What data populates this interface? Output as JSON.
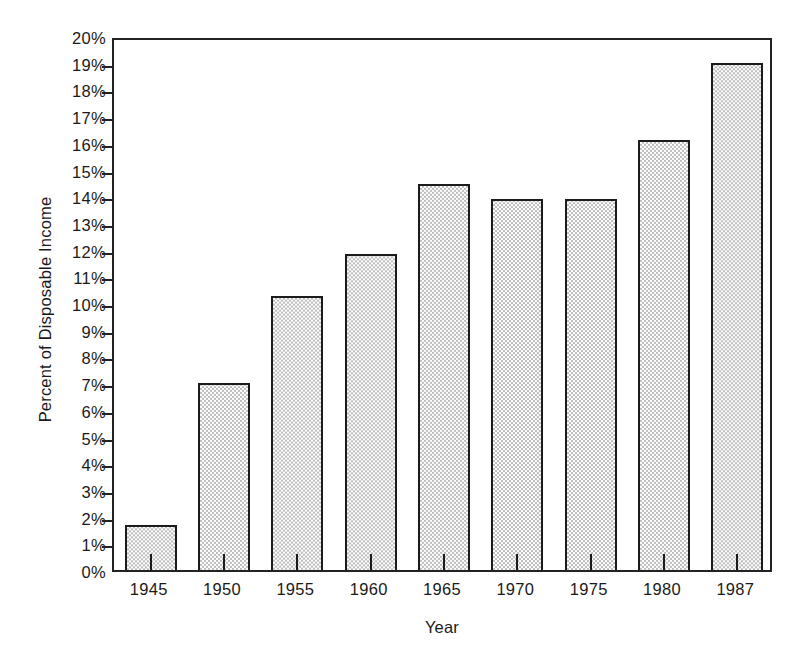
{
  "chart_data": {
    "type": "bar",
    "title": "",
    "subtitle": "",
    "xlabel": "Year",
    "ylabel": "Percent of Disposable Income",
    "categories": [
      "1945",
      "1950",
      "1955",
      "1960",
      "1965",
      "1970",
      "1975",
      "1980",
      "1987"
    ],
    "values": [
      1.7,
      7.0,
      10.25,
      11.85,
      14.45,
      13.9,
      13.9,
      16.1,
      19.0
    ],
    "ylim": [
      0,
      20
    ],
    "ytick_step": 1,
    "ytick_labels": [
      "0%",
      "1%",
      "2%",
      "3%",
      "4%",
      "5%",
      "6%",
      "7%",
      "8%",
      "9%",
      "10%",
      "11%",
      "12%",
      "13%",
      "14%",
      "15%",
      "16%",
      "17%",
      "18%",
      "19%",
      "20%"
    ],
    "xtick_labels": [
      "1945",
      "1950",
      "1955",
      "1960",
      "1965",
      "1970",
      "1975",
      "1980",
      "1987"
    ],
    "grid": false,
    "legend": null,
    "legend_position": "none",
    "annotations": [],
    "bar_fill": "#f2f2f2",
    "bar_pattern": "fine-stipple-dots",
    "bar_border_color": "#1b1b1b",
    "axis_color": "#222222",
    "background": "#ffffff"
  }
}
